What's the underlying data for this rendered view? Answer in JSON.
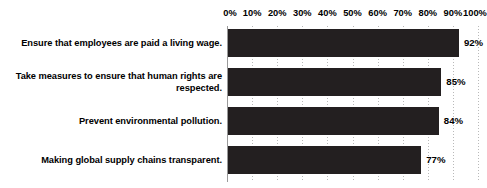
{
  "chart_data": {
    "type": "bar",
    "orientation": "horizontal",
    "title": "",
    "subtitle": "",
    "xlabel": "",
    "ylabel": "",
    "xlim": [
      0,
      100
    ],
    "grid": true,
    "legend": null,
    "value_suffix": "%",
    "categories": [
      "Ensure that employees are paid a living wage.",
      "Take measures to ensure that human rights are respected.",
      "Prevent environmental pollution.",
      "Making global supply chains transparent."
    ],
    "values": [
      92,
      85,
      84,
      77
    ],
    "value_labels": [
      "92%",
      "85%",
      "84%",
      "77%"
    ],
    "xticks": [
      0,
      10,
      20,
      30,
      40,
      50,
      60,
      70,
      80,
      90,
      100
    ],
    "xtick_labels": [
      "0%",
      "10%",
      "20%",
      "30%",
      "40%",
      "50%",
      "60%",
      "70%",
      "80%",
      "90%",
      "100%"
    ],
    "bar_color": "#231f20",
    "gridline_color": "#b9b9b9",
    "axis_color": "#9a9a9a",
    "text_color": "#000000",
    "background_color": "#ffffff"
  }
}
